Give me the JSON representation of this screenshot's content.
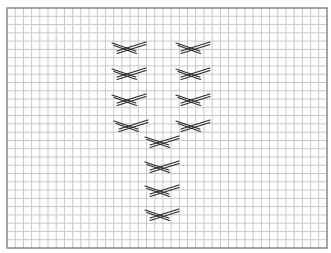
{
  "diagram": {
    "type": "stitch-chart-grid",
    "grid": {
      "left": 7,
      "top": 8,
      "right": 327,
      "bottom": 248,
      "cell_size": 8.2,
      "line_color": "#c8c8c8",
      "border_color": "#888888",
      "background": "#ffffff"
    },
    "stitch_style": {
      "color": "#2a2a2a",
      "stroke_width": 1.2,
      "width": 34,
      "height": 10
    },
    "stitches": [
      {
        "x": 112,
        "y": 42
      },
      {
        "x": 176,
        "y": 42
      },
      {
        "x": 112,
        "y": 68
      },
      {
        "x": 176,
        "y": 68
      },
      {
        "x": 112,
        "y": 94
      },
      {
        "x": 176,
        "y": 94
      },
      {
        "x": 114,
        "y": 120
      },
      {
        "x": 176,
        "y": 120
      },
      {
        "x": 145,
        "y": 136
      },
      {
        "x": 145,
        "y": 161
      },
      {
        "x": 145,
        "y": 185
      },
      {
        "x": 145,
        "y": 209
      }
    ]
  }
}
